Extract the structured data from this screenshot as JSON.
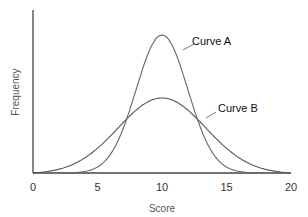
{
  "chart_data": {
    "type": "line",
    "title": "",
    "xlabel": "Score",
    "ylabel": "Frequency",
    "xlim": [
      0,
      20
    ],
    "x_ticks": [
      "0",
      "5",
      "10",
      "15",
      "20"
    ],
    "grid": false,
    "series": [
      {
        "name": "Curve A",
        "mean": 10,
        "spread": "narrow",
        "x": [
          2,
          4,
          6,
          7,
          8,
          9,
          10,
          11,
          12,
          13,
          14,
          16,
          18
        ],
        "values": [
          0,
          0.03,
          0.2,
          0.38,
          0.6,
          0.9,
          1.0,
          0.9,
          0.6,
          0.38,
          0.2,
          0.03,
          0
        ]
      },
      {
        "name": "Curve B",
        "mean": 10,
        "spread": "wide",
        "x": [
          0,
          2,
          4,
          6,
          8,
          10,
          12,
          14,
          16,
          18,
          20
        ],
        "values": [
          0,
          0.06,
          0.18,
          0.38,
          0.62,
          0.7,
          0.62,
          0.38,
          0.18,
          0.06,
          0
        ]
      }
    ],
    "annotations": [
      "Curve A",
      "Curve B"
    ]
  }
}
